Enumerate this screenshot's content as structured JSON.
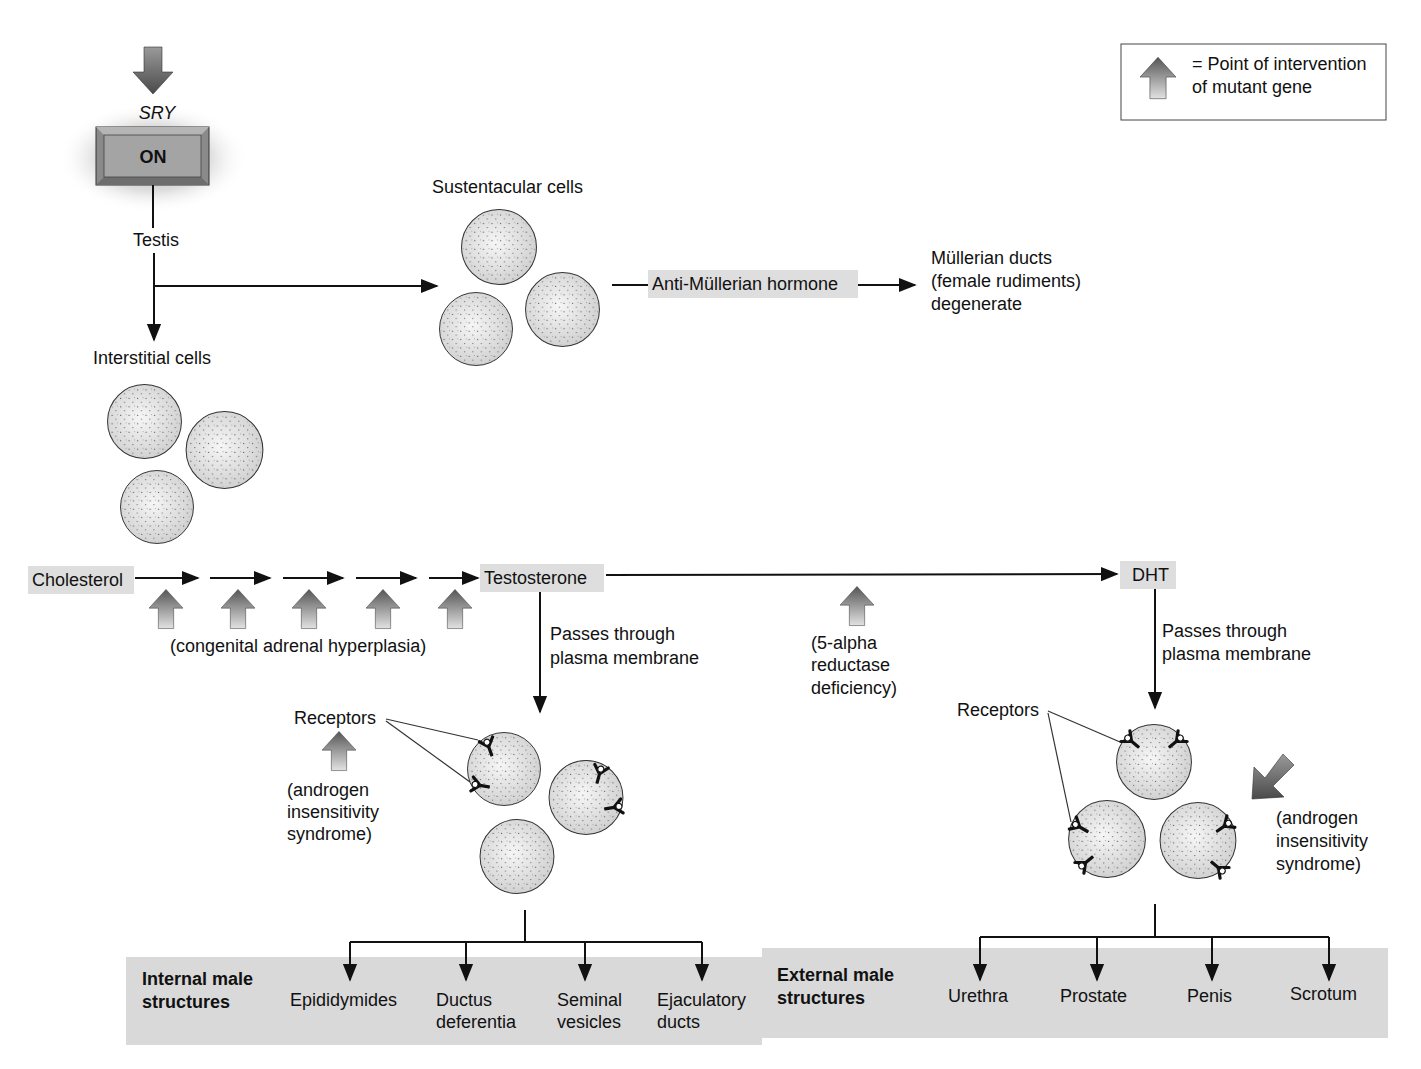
{
  "legend": {
    "line1": "= Point of intervention",
    "line2": "of mutant gene",
    "arrow_icon": "intervention-arrow-icon"
  },
  "sry": {
    "gene_label": "SRY",
    "switch_label": "ON"
  },
  "testis": {
    "label": "Testis"
  },
  "sustentacular": {
    "label": "Sustentacular cells"
  },
  "interstitial": {
    "label": "Interstitial cells"
  },
  "amh": {
    "label": "Anti-Müllerian hormone"
  },
  "mullerian": {
    "line1": "Müllerian ducts",
    "line2": "(female rudiments)",
    "line3": "degenerate"
  },
  "pathway": {
    "cholesterol": "Cholesterol",
    "testosterone": "Testosterone",
    "dht": "DHT",
    "cah_label": "(congenital adrenal hyperplasia)",
    "reductase": {
      "line1": "(5-alpha",
      "line2": "reductase",
      "line3": "deficiency)"
    }
  },
  "testosterone_branch": {
    "passes_line1": "Passes through",
    "passes_line2": "plasma membrane",
    "receptors": "Receptors",
    "ais": {
      "line1": "(androgen",
      "line2": "insensitivity",
      "line3": "syndrome)"
    }
  },
  "dht_branch": {
    "passes_line1": "Passes through",
    "passes_line2": "plasma membrane",
    "receptors": "Receptors",
    "ais": {
      "line1": "(androgen",
      "line2": "insensitivity",
      "line3": "syndrome)"
    }
  },
  "internal": {
    "heading_line1": "Internal male",
    "heading_line2": "structures",
    "items": [
      {
        "line1": "Epididymides",
        "line2": ""
      },
      {
        "line1": "Ductus",
        "line2": "deferentia"
      },
      {
        "line1": "Seminal",
        "line2": "vesicles"
      },
      {
        "line1": "Ejaculatory",
        "line2": "ducts"
      }
    ]
  },
  "external": {
    "heading_line1": "External male",
    "heading_line2": "structures",
    "items": [
      {
        "line1": "Urethra"
      },
      {
        "line1": "Prostate"
      },
      {
        "line1": "Penis"
      },
      {
        "line1": "Scrotum"
      }
    ]
  },
  "colors": {
    "highlight_box": "#dedede",
    "bottom_band": "#d9d9d9",
    "cell_fill": "#e6e6e6",
    "arrow_dark": "#5a5a5a",
    "arrow_light": "#d8d8d8"
  }
}
